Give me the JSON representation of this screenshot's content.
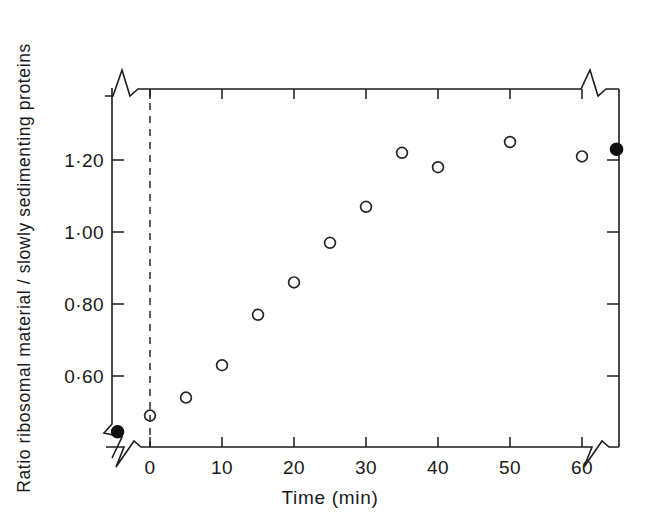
{
  "chart_data": {
    "type": "scatter",
    "title": "",
    "xlabel": "Time (min)",
    "ylabel": "Ratio ribosomal material / slowly sedimenting proteins",
    "xlim": [
      -3,
      65
    ],
    "ylim": [
      0.42,
      1.33
    ],
    "grid": false,
    "legend": null,
    "x_ticks": [
      0,
      10,
      20,
      30,
      40,
      50,
      60
    ],
    "x_tick_labels": [
      "0",
      "10",
      "20",
      "30",
      "40",
      "50",
      "60"
    ],
    "y_ticks": [
      0.6,
      0.8,
      1.0,
      1.2
    ],
    "y_tick_labels": [
      "0·60",
      "0·80",
      "1·00",
      "1·20"
    ],
    "axis_breaks": {
      "x_axis_break_left": true,
      "x_axis_break_right": true,
      "y_axis_break_top": true,
      "y_axis_break_bottom": true,
      "note": "zig-zag break symbols on all four axis rails"
    },
    "annotations": [
      {
        "name": "zero-reference-line",
        "type": "vertical-dashed-line",
        "x": 0
      }
    ],
    "series": [
      {
        "name": "time-course (open circles)",
        "marker": "open-circle",
        "points": [
          {
            "x": 0,
            "y": 0.49
          },
          {
            "x": 5,
            "y": 0.54
          },
          {
            "x": 10,
            "y": 0.63
          },
          {
            "x": 15,
            "y": 0.77
          },
          {
            "x": 20,
            "y": 0.86
          },
          {
            "x": 25,
            "y": 0.97
          },
          {
            "x": 30,
            "y": 1.07
          },
          {
            "x": 35,
            "y": 1.22
          },
          {
            "x": 40,
            "y": 1.18
          },
          {
            "x": 50,
            "y": 1.25
          },
          {
            "x": 60,
            "y": 1.21
          }
        ]
      },
      {
        "name": "reference values (filled circles)",
        "marker": "filled-circle",
        "points": [
          {
            "x": -4.5,
            "y": 0.445
          },
          {
            "x": 64.8,
            "y": 1.23
          }
        ]
      }
    ]
  },
  "axis_labels": {
    "x_title": "Time (min)",
    "y_title": "Ratio  ribosomal  material / slowly  sedimenting  proteins"
  }
}
